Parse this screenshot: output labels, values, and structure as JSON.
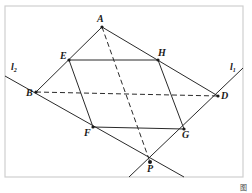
{
  "figure": {
    "caption": "图",
    "frame": {
      "x1": 5,
      "y1": 6,
      "x2": 243,
      "y2": 177,
      "color": "#cccccc"
    },
    "points": {
      "A": {
        "label": "A",
        "x": 102,
        "y": 27
      },
      "B": {
        "label": "B",
        "x": 36,
        "y": 92
      },
      "D": {
        "label": "D",
        "x": 218,
        "y": 96
      },
      "E": {
        "label": "E",
        "x": 69,
        "y": 60
      },
      "F": {
        "label": "F",
        "x": 93,
        "y": 127
      },
      "G": {
        "label": "G",
        "x": 184,
        "y": 129
      },
      "H": {
        "label": "H",
        "x": 158,
        "y": 60
      },
      "P": {
        "label": "P",
        "x": 150,
        "y": 162
      }
    },
    "lines": {
      "l1": {
        "label": "l",
        "subscript": "1"
      },
      "l2": {
        "label": "l",
        "subscript": "2"
      }
    },
    "segments_solid": [
      "AB",
      "AD",
      "EH",
      "HG",
      "GF",
      "FE",
      "l1",
      "l2"
    ],
    "segments_dashed": [
      "AP",
      "BD"
    ],
    "stroke_color": "#2a2a2a"
  }
}
